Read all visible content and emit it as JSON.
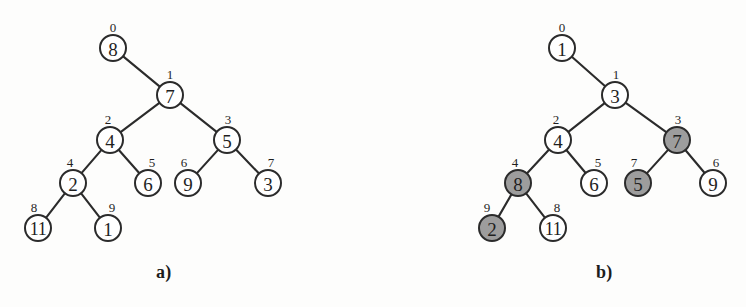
{
  "figure": {
    "background_color": "#fdfdfc",
    "ink_color": "#2b2b2b",
    "shaded_node_color": "#9d9d9d",
    "white_node_color": "#ffffff",
    "node_radius": 13,
    "width": 746,
    "height": 307
  },
  "panels": [
    {
      "id": "a",
      "caption": "a)",
      "caption_x": 156,
      "caption_y": 262,
      "nodes": [
        {
          "index": "0",
          "value": "8",
          "x": 113,
          "y": 48,
          "shaded": false,
          "index_x": 113,
          "index_y": 27
        },
        {
          "index": "1",
          "value": "7",
          "x": 170,
          "y": 95,
          "shaded": false,
          "index_x": 170,
          "index_y": 74
        },
        {
          "index": "2",
          "value": "4",
          "x": 110,
          "y": 140,
          "shaded": false,
          "index_x": 108,
          "index_y": 119
        },
        {
          "index": "3",
          "value": "5",
          "x": 227,
          "y": 140,
          "shaded": false,
          "index_x": 228,
          "index_y": 119
        },
        {
          "index": "4",
          "value": "2",
          "x": 73,
          "y": 183,
          "shaded": false,
          "index_x": 70,
          "index_y": 162
        },
        {
          "index": "5",
          "value": "6",
          "x": 148,
          "y": 183,
          "shaded": false,
          "index_x": 152,
          "index_y": 162
        },
        {
          "index": "6",
          "value": "9",
          "x": 188,
          "y": 183,
          "shaded": false,
          "index_x": 184,
          "index_y": 162
        },
        {
          "index": "7",
          "value": "3",
          "x": 268,
          "y": 183,
          "shaded": false,
          "index_x": 271,
          "index_y": 162
        },
        {
          "index": "8",
          "value": "11",
          "x": 38,
          "y": 228,
          "shaded": false,
          "index_x": 34,
          "index_y": 207
        },
        {
          "index": "9",
          "value": "1",
          "x": 108,
          "y": 228,
          "shaded": false,
          "index_x": 112,
          "index_y": 207
        }
      ],
      "edges": [
        {
          "from": "0",
          "to": "1"
        },
        {
          "from": "1",
          "to": "2"
        },
        {
          "from": "1",
          "to": "3"
        },
        {
          "from": "2",
          "to": "4"
        },
        {
          "from": "2",
          "to": "5"
        },
        {
          "from": "3",
          "to": "6"
        },
        {
          "from": "3",
          "to": "7"
        },
        {
          "from": "4",
          "to": "8"
        },
        {
          "from": "4",
          "to": "9"
        }
      ]
    },
    {
      "id": "b",
      "caption": "b)",
      "caption_x": 596,
      "caption_y": 262,
      "nodes": [
        {
          "index": "0",
          "value": "1",
          "x": 562,
          "y": 48,
          "shaded": false,
          "index_x": 562,
          "index_y": 27
        },
        {
          "index": "1",
          "value": "3",
          "x": 615,
          "y": 95,
          "shaded": false,
          "index_x": 616,
          "index_y": 74
        },
        {
          "index": "2",
          "value": "4",
          "x": 558,
          "y": 140,
          "shaded": false,
          "index_x": 556,
          "index_y": 119
        },
        {
          "index": "3",
          "value": "7",
          "x": 677,
          "y": 140,
          "shaded": true,
          "index_x": 678,
          "index_y": 119
        },
        {
          "index": "4",
          "value": "8",
          "x": 518,
          "y": 183,
          "shaded": true,
          "index_x": 515,
          "index_y": 162
        },
        {
          "index": "5",
          "value": "6",
          "x": 594,
          "y": 183,
          "shaded": false,
          "index_x": 598,
          "index_y": 162
        },
        {
          "index": "7",
          "value": "5",
          "x": 638,
          "y": 183,
          "shaded": true,
          "index_x": 634,
          "index_y": 162
        },
        {
          "index": "6",
          "value": "9",
          "x": 713,
          "y": 183,
          "shaded": false,
          "index_x": 716,
          "index_y": 162
        },
        {
          "index": "9",
          "value": "2",
          "x": 492,
          "y": 228,
          "shaded": true,
          "index_x": 487,
          "index_y": 207
        },
        {
          "index": "8",
          "value": "11",
          "x": 553,
          "y": 228,
          "shaded": false,
          "index_x": 557,
          "index_y": 207
        }
      ],
      "edges": [
        {
          "from": "0",
          "to": "1"
        },
        {
          "from": "1",
          "to": "2"
        },
        {
          "from": "1",
          "to": "3"
        },
        {
          "from": "2",
          "to": "4"
        },
        {
          "from": "2",
          "to": "5"
        },
        {
          "from": "3",
          "to": "7"
        },
        {
          "from": "3",
          "to": "6"
        },
        {
          "from": "4",
          "to": "9"
        },
        {
          "from": "4",
          "to": "8"
        }
      ]
    }
  ]
}
